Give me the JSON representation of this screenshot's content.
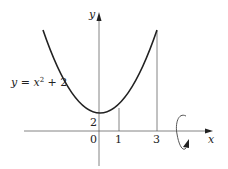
{
  "diagram": {
    "curve": {
      "equation_lhs": "y = x",
      "equation_exp": "2",
      "equation_rhs": " + 2",
      "color": "#222222"
    },
    "axes": {
      "x_label": "x",
      "y_label": "y",
      "color": "#555555"
    },
    "ticks": {
      "origin": "0",
      "x_one": "1",
      "x_three": "3",
      "y_intercept": "2"
    },
    "bounds": {
      "x_lower": 1,
      "x_upper": 3
    },
    "rotation": {
      "axis": "x",
      "icon": "rotation-arrow-icon"
    }
  }
}
